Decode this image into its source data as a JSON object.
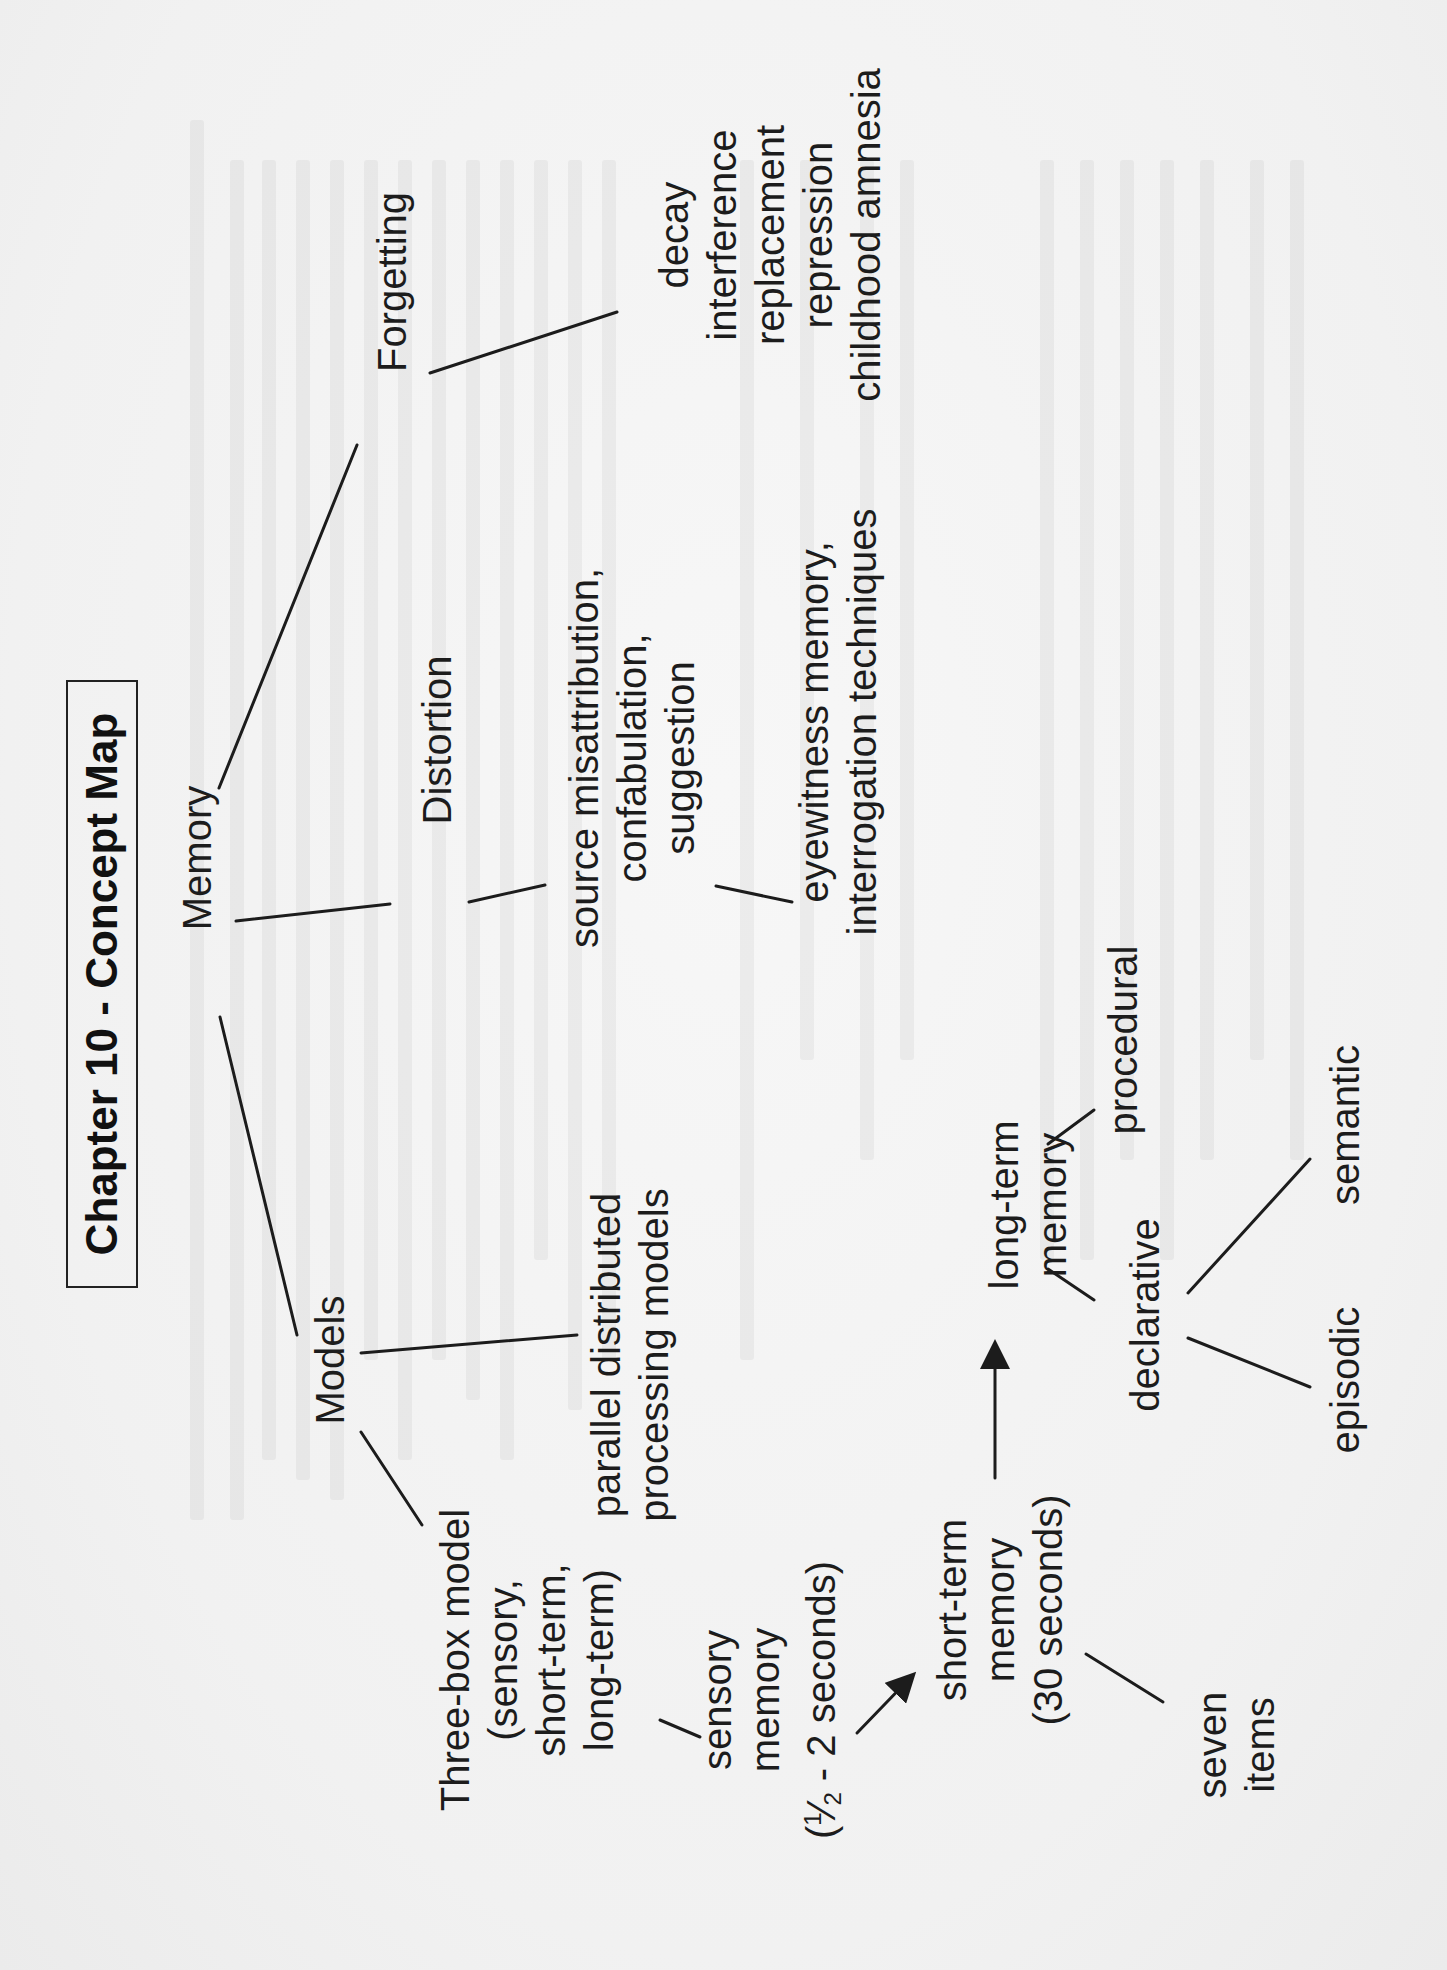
{
  "title": "Chapter 10 - Concept Map",
  "nodes": {
    "memory": "Memory",
    "forgetting": "Forgetting",
    "forgetting_types": [
      "decay",
      "interference",
      "replacement",
      "repression",
      "childhood amnesia"
    ],
    "distortion": "Distortion",
    "distortion_types": [
      "source misattribution,",
      "confabulation,",
      "suggestion"
    ],
    "distortion_applications": [
      "eyewitness  memory,",
      "interrogation techniques"
    ],
    "models": "Models",
    "pdp": [
      "parallel distributed",
      "processing models"
    ],
    "three_box": [
      "Three-box model",
      "(sensory,",
      "short-term,",
      "long-term)"
    ],
    "sensory_memory": {
      "lines": [
        "sensory",
        "memory"
      ],
      "duration_prefix": "(",
      "duration_num": "1",
      "duration_slash": "⁄",
      "duration_den": "2",
      "duration_suffix": " - 2 seconds)"
    },
    "short_term_memory": [
      "short-term",
      "memory",
      "(30 seconds)"
    ],
    "seven_items": [
      "seven",
      "items"
    ],
    "long_term_memory": [
      "long-term",
      "memory"
    ],
    "procedural": "procedural",
    "declarative": "declarative",
    "semantic": "semantic",
    "episodic": "episodic"
  },
  "colors": {
    "paper": "#f3f3f3",
    "ink": "#1c1c1c"
  }
}
